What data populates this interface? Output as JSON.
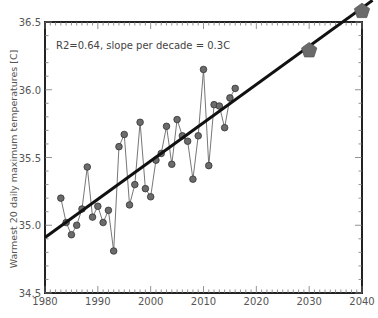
{
  "chart_data": {
    "type": "line",
    "title": "",
    "xlabel": "",
    "ylabel": "Warmest 20 daily maximum temperatures [C]",
    "xlim": [
      1980,
      2040
    ],
    "ylim": [
      34.5,
      36.5
    ],
    "x_ticks": [
      1980,
      1990,
      2000,
      2010,
      2020,
      2030,
      2040
    ],
    "y_ticks": [
      "34.5",
      "35.0",
      "35.5",
      "36.0",
      "36.5"
    ],
    "grid": false,
    "legend": null,
    "annotation": "R2=0.64, slope per decade = 0.3C",
    "series": [
      {
        "name": "observed",
        "style": "line-with-circle-markers",
        "color": "#555555",
        "x": [
          1983,
          1984,
          1985,
          1986,
          1987,
          1988,
          1989,
          1990,
          1991,
          1992,
          1993,
          1994,
          1995,
          1996,
          1997,
          1998,
          1999,
          2000,
          2001,
          2002,
          2003,
          2004,
          2005,
          2006,
          2007,
          2008,
          2009,
          2010,
          2011,
          2012,
          2013,
          2014,
          2015,
          2016
        ],
        "values": [
          35.2,
          35.02,
          34.93,
          35.0,
          35.12,
          35.43,
          35.06,
          35.14,
          35.02,
          35.11,
          34.81,
          35.58,
          35.67,
          35.15,
          35.3,
          35.76,
          35.27,
          35.21,
          35.48,
          35.53,
          35.73,
          35.45,
          35.78,
          35.66,
          35.62,
          35.34,
          35.66,
          36.15,
          35.44,
          35.89,
          35.88,
          35.72,
          35.94,
          36.01
        ]
      },
      {
        "name": "linear trend",
        "style": "thick-line",
        "color": "#111111",
        "x": [
          1980,
          2042
        ],
        "values": [
          34.91,
          36.66
        ]
      },
      {
        "name": "projection",
        "style": "pentagon-markers",
        "color": "#666666",
        "x": [
          2030,
          2040
        ],
        "values": [
          36.29,
          36.58
        ]
      }
    ]
  }
}
